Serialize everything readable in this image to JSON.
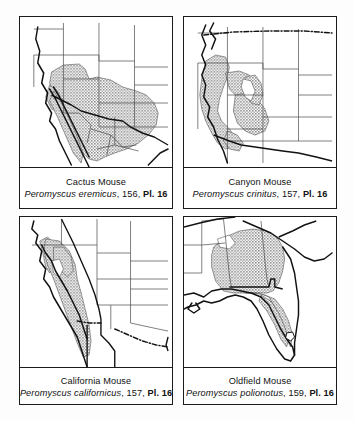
{
  "figure": {
    "type": "range-map-grid",
    "columns": 2,
    "rows": 2,
    "background_color": "#fdfdfd",
    "frame_color": "#1b1b1b",
    "range_shade_color": "#9a9a9a",
    "coastline_color": "#121212",
    "state_border_color": "#4a4a4a"
  },
  "panels": [
    {
      "id": "cactus-mouse",
      "common_name": "Cactus Mouse",
      "scientific_name": "Peromyscus eremicus",
      "page": "156",
      "plate_label": "Pl. 16",
      "separator": ", ",
      "region": "Southwestern United States and northern Mexico",
      "map_extent": "southwest-us-mexico"
    },
    {
      "id": "canyon-mouse",
      "common_name": "Canyon Mouse",
      "scientific_name": "Peromyscus crinitus",
      "page": "157",
      "plate_label": "Pl. 16",
      "separator": ", ",
      "region": "Great Basin and Colorado Plateau",
      "map_extent": "western-us"
    },
    {
      "id": "california-mouse",
      "common_name": "California Mouse",
      "scientific_name": "Peromyscus californicus",
      "page": "157",
      "plate_label": "Pl. 16",
      "separator": ", ",
      "region": "Coastal California and northern Baja California",
      "map_extent": "california-baja"
    },
    {
      "id": "oldfield-mouse",
      "common_name": "Oldfield Mouse",
      "scientific_name": "Peromyscus polionotus",
      "page": "159",
      "plate_label": "Pl. 16",
      "separator": ", ",
      "region": "Southeastern United States and Florida",
      "map_extent": "southeast-us"
    }
  ]
}
